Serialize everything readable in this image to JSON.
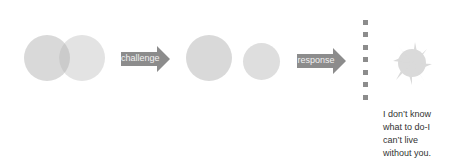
{
  "diagram": {
    "stage1": {
      "description": "two overlapping circles"
    },
    "arrow1": {
      "label": "challenge"
    },
    "stage2": {
      "description": "two separate circles"
    },
    "arrow2": {
      "label": "response"
    },
    "barrier": {
      "description": "vertical dashed line of squares",
      "count": 7
    },
    "stage3": {
      "description": "spiky splat shape"
    },
    "caption": {
      "lines": [
        "I don’t know",
        "what to do-I",
        "can’t live",
        "without you."
      ]
    }
  },
  "colors": {
    "circle_fill": "#d9d9d9",
    "overlap_fill": "#c8c8c8",
    "arrow_fill": "#8c8c8c",
    "square_fill": "#8c8c8c",
    "text": "#333333"
  }
}
